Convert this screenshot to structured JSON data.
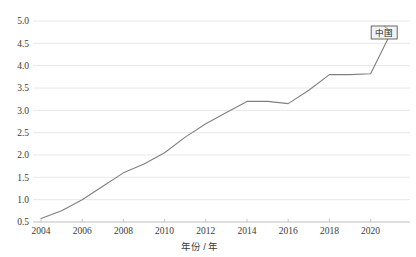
{
  "chart_data": {
    "type": "line",
    "title": "",
    "xlabel": "年份 / 年",
    "ylabel": "",
    "xlim": [
      2004,
      2021
    ],
    "ylim": [
      0.5,
      5.0
    ],
    "grid": true,
    "legend_position": "top-right-inline",
    "xticks": [
      "2004",
      "2006",
      "2008",
      "2010",
      "2012",
      "2014",
      "2016",
      "2018",
      "2020"
    ],
    "xtick_values": [
      2004,
      2006,
      2008,
      2010,
      2012,
      2014,
      2016,
      2018,
      2020
    ],
    "yticks": [
      "0.5",
      "1.0",
      "1.5",
      "2.0",
      "2.5",
      "3.0",
      "3.5",
      "4.0",
      "4.5",
      "5.0"
    ],
    "ytick_values": [
      0.5,
      1.0,
      1.5,
      2.0,
      2.5,
      3.0,
      3.5,
      4.0,
      4.5,
      5.0
    ],
    "x": [
      2004,
      2005,
      2006,
      2007,
      2008,
      2009,
      2010,
      2011,
      2012,
      2013,
      2014,
      2015,
      2016,
      2017,
      2018,
      2019,
      2020,
      2021
    ],
    "series": [
      {
        "name": "中国",
        "color": "#808080",
        "values": [
          0.58,
          0.75,
          1.0,
          1.3,
          1.6,
          1.8,
          2.05,
          2.4,
          2.7,
          2.95,
          3.2,
          3.2,
          3.15,
          3.45,
          3.8,
          3.8,
          3.82,
          4.75
        ]
      }
    ],
    "annotations": [
      {
        "label": "中国",
        "at_x": 2021,
        "at_y": 4.75
      }
    ]
  },
  "legend": {
    "label": "中国"
  },
  "axes": {
    "x_axis_title": "年份 / 年"
  },
  "colors": {
    "line": "#808080",
    "grid": "#e2e2e2",
    "axis": "#b9b9b9",
    "text": "#3b3b3b",
    "legend_border": "#5a5a5a",
    "legend_fill": "#f2f2f2",
    "background": "#ffffff"
  }
}
